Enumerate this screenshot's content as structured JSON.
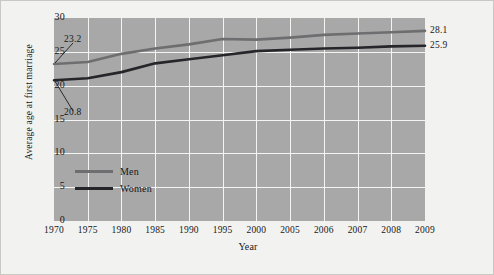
{
  "chart_data": {
    "type": "line",
    "title": "",
    "xlabel": "Year",
    "ylabel": "Average age at first marriage",
    "categories": [
      "1970",
      "1975",
      "1980",
      "1985",
      "1990",
      "1995",
      "2000",
      "2005",
      "2006",
      "2007",
      "2008",
      "2009"
    ],
    "ylim": [
      0,
      30
    ],
    "yticks": [
      "0",
      "5",
      "10",
      "15",
      "20",
      "25",
      "30"
    ],
    "grid": true,
    "legend_position": "inside-lower-left",
    "series": [
      {
        "name": "Men",
        "color": "#6e6e70",
        "values": [
          23.2,
          23.5,
          24.7,
          25.5,
          26.1,
          26.9,
          26.8,
          27.1,
          27.5,
          27.7,
          27.9,
          28.1
        ]
      },
      {
        "name": "Women",
        "color": "#26262a",
        "values": [
          20.8,
          21.1,
          22.0,
          23.3,
          23.9,
          24.5,
          25.1,
          25.3,
          25.5,
          25.6,
          25.8,
          25.9
        ]
      }
    ],
    "annotations": [
      {
        "text": "23.2",
        "series": "Men",
        "point": "1970",
        "placement": "above-right"
      },
      {
        "text": "20.8",
        "series": "Women",
        "point": "1970",
        "placement": "below-right"
      }
    ],
    "end_labels": [
      {
        "text": "28.1",
        "series": "Men",
        "point": "2009"
      },
      {
        "text": "25.9",
        "series": "Women",
        "point": "2009"
      }
    ],
    "plot_background": "#a8a8a8",
    "grid_color": "#f4f4f2",
    "figure_background": "#f2f2f0"
  }
}
